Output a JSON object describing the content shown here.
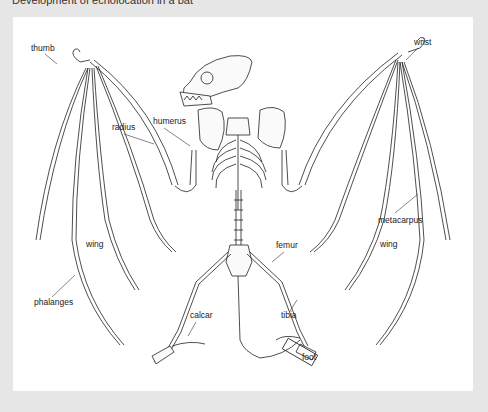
{
  "caption": "Development of echolocation in a bat",
  "diagram": {
    "labels": [
      {
        "id": "thumb",
        "text": "thumb"
      },
      {
        "id": "wrist",
        "text": "wrist"
      },
      {
        "id": "radius",
        "text": "radius"
      },
      {
        "id": "humerus",
        "text": "humerus"
      },
      {
        "id": "metacarpus",
        "text": "metacarpus"
      },
      {
        "id": "wing_right",
        "text": "wing"
      },
      {
        "id": "wing_left",
        "text": "wing"
      },
      {
        "id": "phalanges",
        "text": "phalanges"
      },
      {
        "id": "femur",
        "text": "femur"
      },
      {
        "id": "calcar",
        "text": "calcar"
      },
      {
        "id": "tibia",
        "text": "tibia"
      },
      {
        "id": "foot",
        "text": "foot"
      }
    ]
  },
  "colors": {
    "page_bg": "#e6e6e6",
    "panel_bg": "#ffffff",
    "ink": "#222222"
  }
}
